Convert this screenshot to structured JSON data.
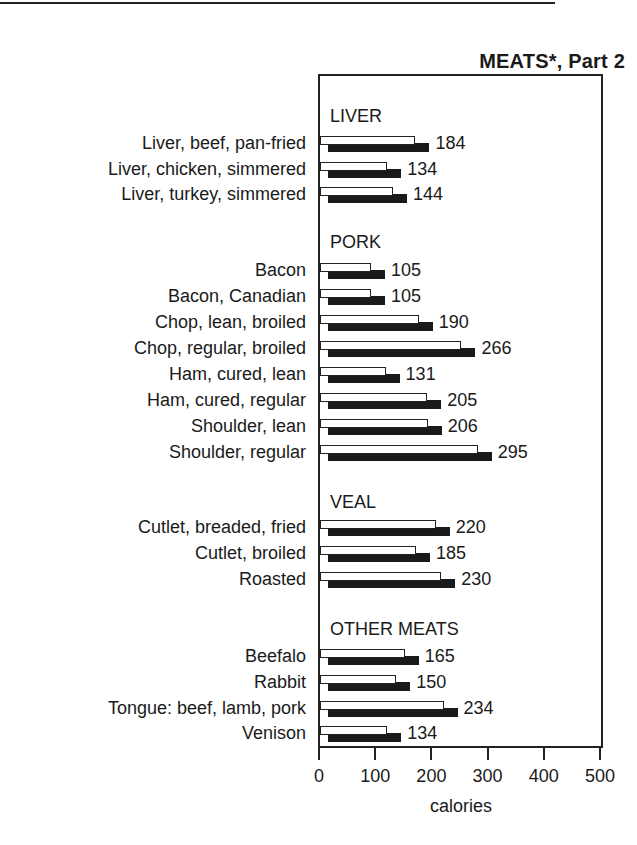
{
  "title": "MEATS*, Part 2",
  "chart_data": {
    "type": "bar",
    "orientation": "horizontal",
    "title": "MEATS*, Part 2",
    "xlabel": "calories",
    "ylabel": "",
    "xlim": [
      0,
      500
    ],
    "x_ticks": [
      0,
      100,
      200,
      300,
      400,
      500
    ],
    "grid": false,
    "legend": null,
    "groups": [
      {
        "name": "LIVER",
        "items": [
          {
            "label": "Liver, beef, pan-fried",
            "value": 184
          },
          {
            "label": "Liver, chicken, simmered",
            "value": 134
          },
          {
            "label": "Liver, turkey, simmered",
            "value": 144
          }
        ]
      },
      {
        "name": "PORK",
        "items": [
          {
            "label": "Bacon",
            "value": 105
          },
          {
            "label": "Bacon, Canadian",
            "value": 105
          },
          {
            "label": "Chop, lean, broiled",
            "value": 190
          },
          {
            "label": "Chop, regular, broiled",
            "value": 266
          },
          {
            "label": "Ham, cured, lean",
            "value": 131
          },
          {
            "label": "Ham, cured, regular",
            "value": 205
          },
          {
            "label": "Shoulder, lean",
            "value": 206
          },
          {
            "label": "Shoulder, regular",
            "value": 295
          }
        ]
      },
      {
        "name": "VEAL",
        "items": [
          {
            "label": "Cutlet, breaded, fried",
            "value": 220
          },
          {
            "label": "Cutlet, broiled",
            "value": 185
          },
          {
            "label": "Roasted",
            "value": 230
          }
        ]
      },
      {
        "name": "OTHER MEATS",
        "items": [
          {
            "label": "Beefalo",
            "value": 165
          },
          {
            "label": "Rabbit",
            "value": 150
          },
          {
            "label": "Tongue: beef, lamb, pork",
            "value": 234
          },
          {
            "label": "Venison",
            "value": 134
          }
        ]
      }
    ]
  },
  "axis": {
    "x_label": "calories",
    "ticks": [
      "0",
      "100",
      "200",
      "300",
      "400",
      "500"
    ]
  },
  "colors": {
    "bar_fill": "#ffffff",
    "bar_outline": "#222222",
    "bar_shadow": "#1a1a1a",
    "text": "#1a1a1a"
  }
}
